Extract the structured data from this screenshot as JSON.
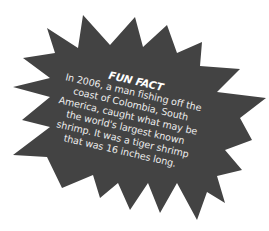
{
  "callout": {
    "shape": "starburst",
    "fill_color": "#434343",
    "text_color": "#ececec",
    "title": "FUN FACT",
    "lines": [
      "In 2006, a man fishing off the",
      "coast of Colombia, South",
      "America, caught what may be",
      "the world's largest known",
      "shrimp. It was a tiger shrimp",
      "that was 16 inches long."
    ]
  }
}
